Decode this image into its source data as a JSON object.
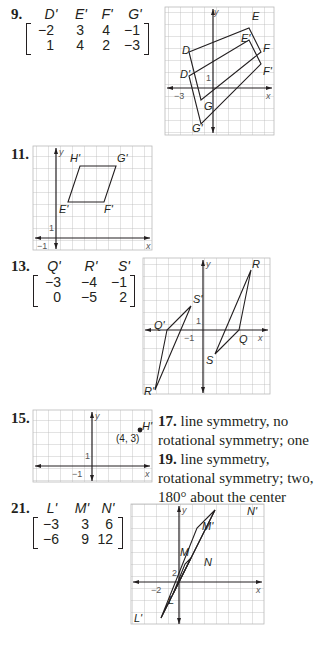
{
  "problems": {
    "p9": {
      "number": "9.",
      "matrix": {
        "headers": [
          "D'",
          "E'",
          "F'",
          "G'"
        ],
        "rows": [
          [
            "−2",
            "3",
            "4",
            "−1"
          ],
          [
            "1",
            "4",
            "2",
            "−3"
          ]
        ]
      },
      "graph": {
        "labels": {
          "y": "y",
          "x": "x",
          "tick_y": "1",
          "tick_x": "−3",
          "D": "D",
          "E": "E",
          "F": "F",
          "G": "G",
          "Dp": "D'",
          "Ep": "E'",
          "Fp": "F'",
          "Gp": "G'"
        }
      }
    },
    "p11": {
      "number": "11.",
      "graph": {
        "labels": {
          "y": "y",
          "x": "x",
          "tick_y": "1",
          "tick_x": "−1",
          "Hp": "H'",
          "Gp": "G'",
          "Ep": "E'",
          "Fp": "F'"
        }
      }
    },
    "p13": {
      "number": "13.",
      "matrix": {
        "headers": [
          "Q'",
          "R'",
          "S'"
        ],
        "rows": [
          [
            "−3",
            "−4",
            "−1"
          ],
          [
            "0",
            "−5",
            "2"
          ]
        ]
      },
      "graph": {
        "labels": {
          "y": "y",
          "x": "x",
          "tick_y": "1",
          "tick_x": "−1",
          "Q": "Q",
          "R": "R",
          "S": "S",
          "Qp": "Q'",
          "Rp": "R'",
          "Sp": "S'"
        }
      }
    },
    "p15": {
      "number": "15.",
      "graph": {
        "labels": {
          "y": "y",
          "x": "x",
          "tick_y": "1",
          "tick_x": "−1",
          "Hp": "H'",
          "coord": "(4, 3)"
        }
      }
    },
    "p17": {
      "number": "17.",
      "text": "line symmetry, no rotational symmetry; one"
    },
    "p19": {
      "number": "19.",
      "text": "line symmetry, rotational symmetry; two, 180° about the center"
    },
    "p21": {
      "number": "21.",
      "matrix": {
        "headers": [
          "L'",
          "M'",
          "N'"
        ],
        "rows": [
          [
            "−3",
            "3",
            "6"
          ],
          [
            "−6",
            "9",
            "12"
          ]
        ]
      },
      "graph": {
        "labels": {
          "y": "y",
          "x": "x",
          "tick_y": "2",
          "tick_x": "−2",
          "L": "L",
          "M": "M",
          "N": "N",
          "Lp": "L'",
          "Mp": "M'",
          "Np": "N'"
        }
      }
    }
  }
}
